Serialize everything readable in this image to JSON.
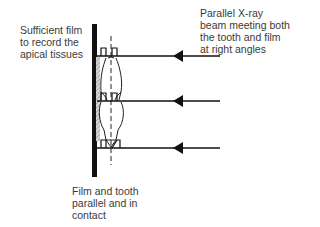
{
  "diagram": {
    "labels": {
      "film_extent": "Sufficient film\nto record the\napical tissues",
      "beam": "Parallel X-ray\nbeam meeting both\nthe tooth and film\nat right angles",
      "contact": "Film and tooth\nparallel and in\ncontact"
    },
    "elements": {
      "film": "image receptor (film), vertical",
      "tooth": "tooth outline with long axis",
      "beams": [
        "upper X-ray beam",
        "middle X-ray beam",
        "lower X-ray beam"
      ],
      "right_angle_markers": 6
    },
    "colors": {
      "ink": "#111111",
      "hatch": "#9a9a9a",
      "text": "#3a3a3a"
    }
  }
}
